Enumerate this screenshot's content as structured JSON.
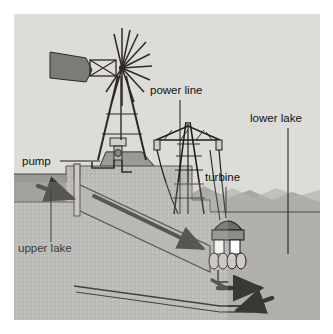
{
  "figure": {
    "panel": {
      "width": 306,
      "height": 306,
      "background": "#e9e7e3"
    }
  },
  "labels": [
    {
      "id": "pump",
      "text": "pump",
      "x": 22,
      "y": 150,
      "anchor": "start",
      "leader": {
        "x1": 60,
        "y1": 147,
        "x2": 86,
        "y2": 147
      }
    },
    {
      "id": "power_line",
      "text": "power line",
      "x": 150,
      "y": 92,
      "anchor": "start",
      "leader": {
        "x1": 180,
        "y1": 96,
        "x2": 180,
        "y2": 205
      }
    },
    {
      "id": "lower_lake",
      "text": "lower lake",
      "x": 250,
      "y": 119,
      "anchor": "start",
      "leader": {
        "x1": 288,
        "y1": 123,
        "x2": 288,
        "y2": 240
      }
    },
    {
      "id": "turbine",
      "text": "turbine",
      "x": 205,
      "y": 178,
      "anchor": "start",
      "leader": {
        "x1": 226,
        "y1": 182,
        "x2": 226,
        "y2": 212
      }
    },
    {
      "id": "upper_lake",
      "text": "upper lake",
      "x": 16,
      "y": 243,
      "anchor": "start",
      "leader": {
        "x1": 51,
        "y1": 236,
        "x2": 51,
        "y2": 187
      }
    }
  ],
  "scene": {
    "sky_color": "#dedcd8",
    "mountain_color": "#a7a5a2",
    "ground_color": "#bdbbb7",
    "water_color": "#b2b0ac",
    "structure_color": "#8e8c89",
    "dark_color": "#3c3a38",
    "line_color": "#222222",
    "parts": [
      {
        "name": "sky"
      },
      {
        "name": "distant-mountains"
      },
      {
        "name": "ground-cross-section"
      },
      {
        "name": "upper-lake-water"
      },
      {
        "name": "lower-lake-water"
      },
      {
        "name": "windmill-rotor"
      },
      {
        "name": "windmill-tail-vane"
      },
      {
        "name": "windmill-tower"
      },
      {
        "name": "pump-housing"
      },
      {
        "name": "dam-embankment"
      },
      {
        "name": "penstock-tunnel"
      },
      {
        "name": "penstock-flow-arrow"
      },
      {
        "name": "upper-lake-flow-arrow"
      },
      {
        "name": "transmission-tower"
      },
      {
        "name": "transmission-cables"
      },
      {
        "name": "turbine-dome"
      },
      {
        "name": "turbine-housing"
      },
      {
        "name": "turbine-coils"
      },
      {
        "name": "turbine-outflow-pipe"
      },
      {
        "name": "turbine-outflow-arrow"
      },
      {
        "name": "return-pipe"
      },
      {
        "name": "return-flow-arrow"
      }
    ]
  }
}
